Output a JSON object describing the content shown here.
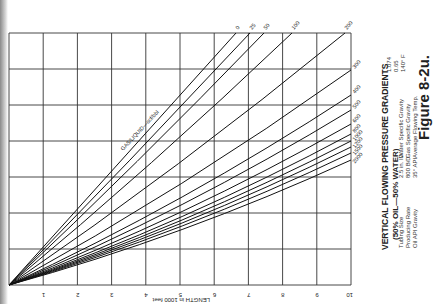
{
  "chart_data": {
    "type": "line",
    "title": "VERTICAL FLOWING PRESSURE GRADIENTS",
    "subtitle": "(50% OIL—50% WATER)",
    "figure_label": "Figure 8-2u.",
    "xlabel": "LENGTH in 1000 feet",
    "ylabel": "",
    "x_ticks": [
      "1",
      "2",
      "3",
      "4",
      "5",
      "6",
      "7",
      "8",
      "9",
      "10"
    ],
    "xlim": [
      0,
      10
    ],
    "grid": true,
    "series_label": "GAS/LIQUID—scf/bbl",
    "series": [
      {
        "name": "0",
        "end": [
          236,
          33
        ]
      },
      {
        "name": "25",
        "end": [
          250,
          33
        ]
      },
      {
        "name": "50",
        "end": [
          264,
          33
        ]
      },
      {
        "name": "100",
        "end": [
          292,
          33
        ]
      },
      {
        "name": "200",
        "end": [
          345,
          33
        ]
      },
      {
        "name": "300",
        "end": [
          351,
          70
        ]
      },
      {
        "name": "400",
        "end": [
          351,
          95
        ]
      },
      {
        "name": "500",
        "end": [
          351,
          110
        ]
      },
      {
        "name": "600",
        "end": [
          351,
          124
        ]
      },
      {
        "name": "800",
        "end": [
          351,
          134
        ]
      },
      {
        "name": "1000",
        "end": [
          351,
          141
        ]
      },
      {
        "name": "1200",
        "end": [
          351,
          147
        ]
      },
      {
        "name": "1500",
        "end": [
          351,
          153
        ]
      },
      {
        "name": "2000",
        "end": [
          351,
          160
        ]
      }
    ],
    "conditions": {
      "labels": [
        "Tubing Size",
        "Producing Rate",
        "Oil API Gravity"
      ],
      "values": [
        "2.5 in. ID",
        "800 B/D",
        "35° API"
      ],
      "labels2": [
        "Water Specific Gravity",
        "Gas Specific Gravity",
        "Average Flowing Temp."
      ],
      "values2": [
        "1.074",
        "0.65",
        "140° F"
      ]
    }
  }
}
